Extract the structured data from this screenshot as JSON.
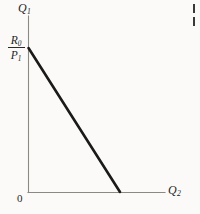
{
  "figure": {
    "background_color": "#fbfaf8",
    "axis_color": "#8a8a85",
    "line_color": "#1a1a18",
    "text_color": "#26251f",
    "origin_label": "0",
    "y_axis_label_base": "Q",
    "y_axis_label_sub": "1",
    "x_axis_label_base": "Q",
    "x_axis_label_sub": "2",
    "intercept_numerator_base": "R",
    "intercept_numerator_sub": "0",
    "intercept_denominator_base": "P",
    "intercept_denominator_sub": "1"
  },
  "chart_data": {
    "type": "line",
    "title": "",
    "subtitle": "",
    "xlabel": "Q2",
    "ylabel": "Q1",
    "grid": false,
    "legend": null,
    "xlim": [
      0,
      1
    ],
    "ylim": [
      0,
      1
    ],
    "axis_ticks": {
      "x": [],
      "y": []
    },
    "annotations": [
      {
        "text": "0",
        "role": "origin-label",
        "x": 0,
        "y": 0
      },
      {
        "text": "Q1",
        "role": "y-axis-title",
        "x": 0,
        "y": 1
      },
      {
        "text": "Q2",
        "role": "x-axis-title",
        "x": 1,
        "y": 0
      },
      {
        "text": "R0/P1",
        "role": "y-intercept-label",
        "x": 0,
        "y": 0.82
      }
    ],
    "series": [
      {
        "name": "budget-constraint",
        "type": "line",
        "color": "#1a1a18",
        "width": 2.6,
        "x": [
          0,
          0.666
        ],
        "y": [
          0.818,
          0
        ]
      }
    ],
    "axes_geometry_px": {
      "origin": [
        28,
        192
      ],
      "y_axis_top": [
        28,
        16
      ],
      "x_axis_right": [
        165,
        192
      ],
      "line_start": [
        28,
        48
      ],
      "line_end": [
        120,
        192
      ]
    }
  }
}
